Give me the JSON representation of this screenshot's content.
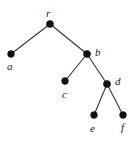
{
  "figure": {
    "name": "rooted-tree-diagram",
    "background_color": "#ffffff",
    "width": 137,
    "height": 143,
    "node_color": "#111111",
    "edge_color": "#3a3a3a"
  },
  "chart_data": {
    "type": "diagram",
    "diagram_type": "rooted-tree",
    "title": "",
    "nodes": [
      {
        "id": "r",
        "label": "r",
        "x": 50,
        "y": 24,
        "radius": 3.6,
        "label_x": 46,
        "label_y": 8,
        "label_position": "above"
      },
      {
        "id": "a",
        "label": "a",
        "x": 11,
        "y": 54,
        "radius": 3.4,
        "label_x": 7,
        "label_y": 61,
        "label_position": "below"
      },
      {
        "id": "b",
        "label": "b",
        "x": 87,
        "y": 54,
        "radius": 3.6,
        "label_x": 95,
        "label_y": 47,
        "label_position": "right"
      },
      {
        "id": "c",
        "label": "c",
        "x": 65,
        "y": 81,
        "radius": 3.4,
        "label_x": 62,
        "label_y": 89,
        "label_position": "below"
      },
      {
        "id": "d",
        "label": "d",
        "x": 107,
        "y": 84,
        "radius": 3.6,
        "label_x": 115,
        "label_y": 76,
        "label_position": "right"
      },
      {
        "id": "e",
        "label": "e",
        "x": 94,
        "y": 115,
        "radius": 3.4,
        "label_x": 90,
        "label_y": 123,
        "label_position": "below"
      },
      {
        "id": "f",
        "label": "f",
        "x": 123,
        "y": 115,
        "radius": 3.4,
        "label_x": 121,
        "label_y": 122,
        "label_position": "below"
      }
    ],
    "edges": [
      {
        "from": "r",
        "to": "a",
        "x1": 50,
        "y1": 24,
        "x2": 11,
        "y2": 54
      },
      {
        "from": "r",
        "to": "b",
        "x1": 50,
        "y1": 24,
        "x2": 87,
        "y2": 54
      },
      {
        "from": "b",
        "to": "c",
        "x1": 87,
        "y1": 54,
        "x2": 65,
        "y2": 81
      },
      {
        "from": "b",
        "to": "d",
        "x1": 87,
        "y1": 54,
        "x2": 107,
        "y2": 84
      },
      {
        "from": "d",
        "to": "e",
        "x1": 107,
        "y1": 84,
        "x2": 94,
        "y2": 115
      },
      {
        "from": "d",
        "to": "f",
        "x1": 107,
        "y1": 84,
        "x2": 123,
        "y2": 115
      }
    ],
    "root": "r",
    "leaves": [
      "a",
      "c",
      "e",
      "f"
    ],
    "node_count": 7,
    "edge_count": 6
  }
}
